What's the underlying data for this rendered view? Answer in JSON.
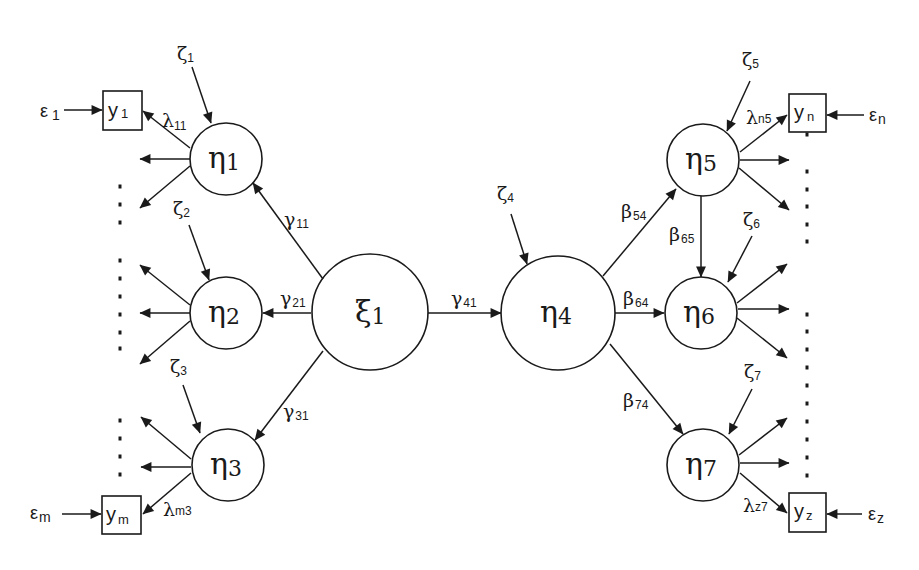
{
  "diagram": {
    "type": "structural-equation-model",
    "colors": {
      "stroke": "#1a1a1a",
      "background": "#ffffff"
    },
    "exogenous": [
      {
        "id": "xi1",
        "symbol": "ξ",
        "sub": "1",
        "cx": 370,
        "cy": 312,
        "r": 58
      }
    ],
    "endogenous": [
      {
        "id": "eta1",
        "symbol": "η",
        "sub": "1",
        "cx": 226,
        "cy": 159,
        "r": 36
      },
      {
        "id": "eta2",
        "symbol": "η",
        "sub": "2",
        "cx": 226,
        "cy": 313,
        "r": 36
      },
      {
        "id": "eta3",
        "symbol": "η",
        "sub": "3",
        "cx": 228,
        "cy": 465,
        "r": 36
      },
      {
        "id": "eta4",
        "symbol": "η",
        "sub": "4",
        "cx": 558,
        "cy": 313,
        "r": 57
      },
      {
        "id": "eta5",
        "symbol": "η",
        "sub": "5",
        "cx": 703,
        "cy": 160,
        "r": 36
      },
      {
        "id": "eta6",
        "symbol": "η",
        "sub": "6",
        "cx": 701,
        "cy": 313,
        "r": 36
      },
      {
        "id": "eta7",
        "symbol": "η",
        "sub": "7",
        "cx": 703,
        "cy": 465,
        "r": 36
      }
    ],
    "indicators": [
      {
        "id": "y1",
        "symbol": "y",
        "sub": "1",
        "error": "ε",
        "error_sub": "1"
      },
      {
        "id": "ym",
        "symbol": "y",
        "sub": "m",
        "error": "ε",
        "error_sub": "m"
      },
      {
        "id": "yn",
        "symbol": "y",
        "sub": "n",
        "error": "ε",
        "error_sub": "n"
      },
      {
        "id": "yz",
        "symbol": "y",
        "sub": "z",
        "error": "ε",
        "error_sub": "z"
      }
    ],
    "disturbances": [
      {
        "symbol": "ζ",
        "sub": "1",
        "target": "eta1"
      },
      {
        "symbol": "ζ",
        "sub": "2",
        "target": "eta2"
      },
      {
        "symbol": "ζ",
        "sub": "3",
        "target": "eta3"
      },
      {
        "symbol": "ζ",
        "sub": "4",
        "target": "eta4"
      },
      {
        "symbol": "ζ",
        "sub": "5",
        "target": "eta5"
      },
      {
        "symbol": "ζ",
        "sub": "6",
        "target": "eta6"
      },
      {
        "symbol": "ζ",
        "sub": "7",
        "target": "eta7"
      }
    ],
    "paths": [
      {
        "from": "xi1",
        "to": "eta1",
        "symbol": "γ",
        "sub": "11"
      },
      {
        "from": "xi1",
        "to": "eta2",
        "symbol": "γ",
        "sub": "21"
      },
      {
        "from": "xi1",
        "to": "eta3",
        "symbol": "γ",
        "sub": "31"
      },
      {
        "from": "xi1",
        "to": "eta4",
        "symbol": "γ",
        "sub": "41"
      },
      {
        "from": "eta4",
        "to": "eta5",
        "symbol": "β",
        "sub": "54"
      },
      {
        "from": "eta4",
        "to": "eta6",
        "symbol": "β",
        "sub": "64"
      },
      {
        "from": "eta4",
        "to": "eta7",
        "symbol": "β",
        "sub": "74"
      },
      {
        "from": "eta5",
        "to": "eta6",
        "symbol": "β",
        "sub": "65"
      }
    ],
    "loadings": [
      {
        "from": "eta1",
        "to": "y1",
        "symbol": "λ",
        "sub": "11"
      },
      {
        "from": "eta3",
        "to": "ym",
        "symbol": "λ",
        "sub": "m3"
      },
      {
        "from": "eta5",
        "to": "yn",
        "symbol": "λ",
        "sub": "n5"
      },
      {
        "from": "eta7",
        "to": "yz",
        "symbol": "λ",
        "sub": "z7"
      }
    ]
  }
}
